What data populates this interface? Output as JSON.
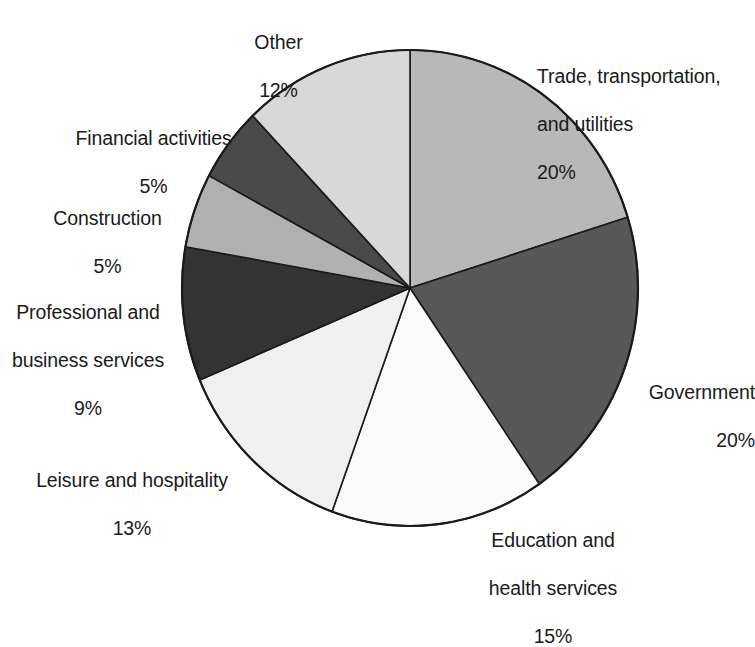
{
  "chart_data": {
    "type": "pie",
    "title": "",
    "subtitle": "",
    "xlabel": "",
    "ylabel": "",
    "legend_position": "outside-labels",
    "grid": false,
    "value_unit": "%",
    "start_angle_deg": 0,
    "direction": "clockwise",
    "categories": [
      "Trade, transportation, and utilities",
      "Government",
      "Education and health services",
      "Leisure and hospitality",
      "Professional and business services",
      "Construction",
      "Financial activities",
      "Other"
    ],
    "values": [
      20,
      20,
      15,
      13,
      9,
      5,
      5,
      12
    ],
    "slices": [
      {
        "id": "trade",
        "label": "Trade, transportation,\nand utilities",
        "label_line1": "Trade, transportation,",
        "label_line2": "and utilities",
        "value": 20,
        "value_text": "20%",
        "color": "#b8b8b8"
      },
      {
        "id": "government",
        "label": "Government",
        "label_line1": "Government",
        "label_line2": "",
        "value": 20,
        "value_text": "20%",
        "color": "#585858"
      },
      {
        "id": "education",
        "label": "Education and\nhealth services",
        "label_line1": "Education and",
        "label_line2": "health services",
        "value": 15,
        "value_text": "15%",
        "color": "#fafafa"
      },
      {
        "id": "leisure",
        "label": "Leisure and hospitality",
        "label_line1": "Leisure and hospitality",
        "label_line2": "",
        "value": 13,
        "value_text": "13%",
        "color": "#f0f0f0"
      },
      {
        "id": "professional",
        "label": "Professional and\nbusiness services",
        "label_line1": "Professional and",
        "label_line2": "business services",
        "value": 9,
        "value_text": "9%",
        "color": "#333333"
      },
      {
        "id": "construction",
        "label": "Construction",
        "label_line1": "Construction",
        "label_line2": "",
        "value": 5,
        "value_text": "5%",
        "color": "#b0b0b0"
      },
      {
        "id": "financial",
        "label": "Financial activities",
        "label_line1": "Financial activities",
        "label_line2": "",
        "value": 5,
        "value_text": "5%",
        "color": "#4a4a4a"
      },
      {
        "id": "other",
        "label": "Other",
        "label_line1": "Other",
        "label_line2": "",
        "value": 12,
        "value_text": "12%",
        "color": "#d8d8d8"
      }
    ],
    "geometry": {
      "center_x": 410,
      "center_y": 288,
      "radius_x": 228,
      "radius_y": 238
    },
    "style": {
      "background": "#ffffff",
      "outline_color": "#1a1a1a",
      "text_color": "#1a1a1a"
    }
  }
}
